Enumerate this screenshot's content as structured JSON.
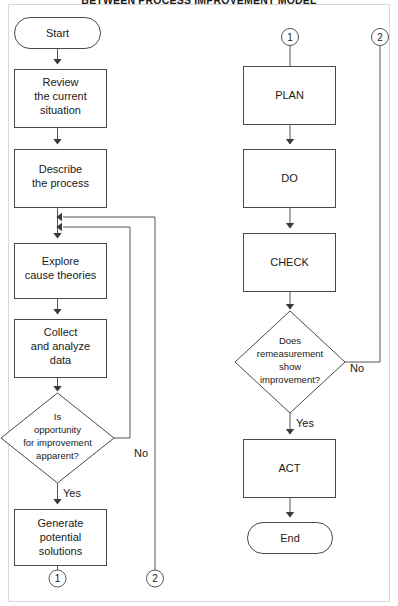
{
  "figure": {
    "title": "BETWEEN PROCESS IMPROVEMENT MODEL",
    "width": 398,
    "height": 606,
    "line_color": "#555555",
    "shape_fill": "#ffffff",
    "text_color": "#1a1a1a"
  },
  "left_column": {
    "start": {
      "label": "Start",
      "shape": "terminator"
    },
    "step1": {
      "line1": "Review",
      "line2": "the current",
      "line3": "situation",
      "shape": "process"
    },
    "step2": {
      "line1": "Describe",
      "line2": "the process",
      "shape": "process"
    },
    "step3": {
      "line1": "Explore",
      "line2": "cause theories",
      "shape": "process"
    },
    "step4": {
      "line1": "Collect",
      "line2": "and analyze",
      "line3": "data",
      "shape": "process"
    },
    "decision": {
      "line1": "Is",
      "line2": "opportunity",
      "line3": "for improvement",
      "line4": "apparent?",
      "shape": "decision",
      "branch_no": "No",
      "branch_yes": "Yes"
    },
    "step5": {
      "line1": "Generate",
      "line2": "potential",
      "line3": "solutions",
      "shape": "process"
    },
    "exit_connector": "1"
  },
  "right_column": {
    "entry_connector": "1",
    "return_connector": "2",
    "plan": {
      "label": "PLAN",
      "shape": "process"
    },
    "do": {
      "label": "DO",
      "shape": "process"
    },
    "check": {
      "label": "CHECK",
      "shape": "process"
    },
    "decision": {
      "line1": "Does",
      "line2": "remeasurement",
      "line3": "show",
      "line4": "improvement?",
      "shape": "decision",
      "branch_no": "No",
      "branch_yes": "Yes"
    },
    "act": {
      "label": "ACT",
      "shape": "process"
    },
    "end": {
      "label": "End",
      "shape": "terminator"
    }
  },
  "bottom_connectors": {
    "left": "1",
    "right": "2"
  }
}
